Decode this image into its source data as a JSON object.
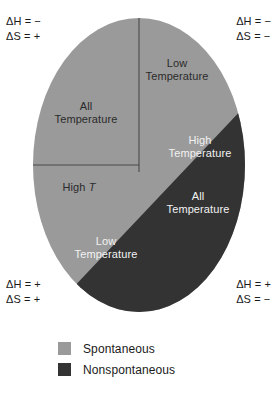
{
  "figure": {
    "colors": {
      "spontaneous": "#9a9a9a",
      "nonspontaneous": "#333333",
      "divider": "#4a4a4a",
      "background": "#ffffff",
      "dark_text": "#2b2b2b",
      "light_text": "#f2f2f2"
    },
    "shape": {
      "type": "ellipse",
      "cx": 139,
      "cy": 165,
      "rx": 106,
      "ry": 147
    },
    "corner_labels": [
      {
        "position": "top-left",
        "enthalpy_symbol": "ΔH",
        "enthalpy_value": "−",
        "enthalpy_text": "ΔH = −",
        "entropy_symbol": "ΔS",
        "entropy_value": "+",
        "entropy_text": "ΔS = +"
      },
      {
        "position": "top-right",
        "enthalpy_symbol": "ΔH",
        "enthalpy_value": "−",
        "enthalpy_text": "ΔH = −",
        "entropy_symbol": "ΔS",
        "entropy_value": "−",
        "entropy_text": "ΔS = −"
      },
      {
        "position": "bottom-left",
        "enthalpy_symbol": "ΔH",
        "enthalpy_value": "+",
        "enthalpy_text": "ΔH = +",
        "entropy_symbol": "ΔS",
        "entropy_value": "+",
        "entropy_text": "ΔS = +"
      },
      {
        "position": "bottom-right",
        "enthalpy_symbol": "ΔH",
        "enthalpy_value": "+",
        "enthalpy_text": "ΔH = +",
        "entropy_symbol": "ΔS",
        "entropy_value": "−",
        "entropy_text": "ΔS = −"
      }
    ],
    "region_labels": {
      "low_temperature_top": {
        "line1": "Low",
        "line2": "Temperature",
        "region": "spontaneous"
      },
      "all_temperature_top": {
        "line1": "All",
        "line2": "Temperature",
        "region": "spontaneous"
      },
      "high_temperature_right": {
        "line1": "High",
        "line2": "Temperature",
        "region": "nonspontaneous"
      },
      "high_t": {
        "line1": "High",
        "symbol": "T",
        "region": "spontaneous"
      },
      "all_temperature_bottom": {
        "line1": "All",
        "line2": "Temperature",
        "region": "nonspontaneous"
      },
      "low_temperature_bottom": {
        "line1": "Low",
        "line2": "Temperature",
        "region": "nonspontaneous"
      }
    }
  },
  "legend": {
    "items": [
      {
        "label": "Spontaneous",
        "color": "#9a9a9a"
      },
      {
        "label": "Nonspontaneous",
        "color": "#333333"
      }
    ]
  }
}
